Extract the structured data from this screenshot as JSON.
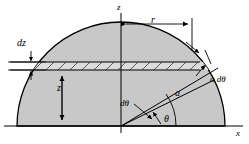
{
  "labels": {
    "z_axis": "z",
    "x_axis": "x",
    "radius_r": "r",
    "thickness_dz": "dz",
    "height_z": "z",
    "arc_element": "a dθ",
    "radius_a": "a",
    "angle_increment": "dθ",
    "angle_theta": "θ"
  },
  "colors": {
    "fill": "#c8c8c8",
    "stroke": "#000000",
    "hatch": "#555555",
    "strip_fill": "#d9d9d9",
    "background": "#ffffff"
  },
  "geometry": {
    "origin_x": 121,
    "origin_y": 126,
    "radius": 104,
    "strip_top_y": 62,
    "strip_bottom_y": 70,
    "theta_deg": 33,
    "dtheta_deg": 10
  }
}
